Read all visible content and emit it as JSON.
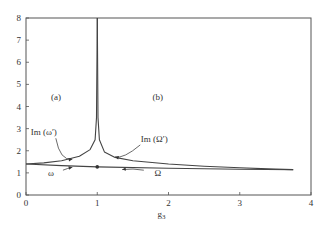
{
  "chart_data": {
    "type": "line",
    "title": "",
    "xlabel": "g3",
    "ylabel": "",
    "xlim": [
      0,
      4
    ],
    "ylim": [
      0,
      8
    ],
    "x_ticks": [
      "0",
      "1",
      "2",
      "3",
      "4"
    ],
    "y_ticks": [
      "0",
      "1",
      "2",
      "3",
      "4",
      "5",
      "6",
      "7",
      "8"
    ],
    "grid": false,
    "legend": "none (inline annotations)",
    "panel_labels": [
      "(a)",
      "(b)"
    ],
    "series": [
      {
        "name": "Im (ω′)",
        "region": "a",
        "x": [
          0,
          0.25,
          0.5,
          0.75,
          0.9,
          0.97,
          0.99,
          1.0
        ],
        "y": [
          1.4,
          1.45,
          1.55,
          1.75,
          2.05,
          2.5,
          3.5,
          8.0
        ]
      },
      {
        "name": "Im (Ω′)",
        "region": "b",
        "x": [
          1.0,
          1.01,
          1.03,
          1.1,
          1.25,
          1.5,
          2.0,
          2.5,
          3.0,
          3.5,
          3.75
        ],
        "y": [
          8.0,
          3.5,
          2.5,
          1.95,
          1.7,
          1.55,
          1.4,
          1.3,
          1.23,
          1.17,
          1.15
        ]
      },
      {
        "name": "ω",
        "region": "a",
        "x": [
          0,
          0.5,
          1.0
        ],
        "y": [
          1.4,
          1.33,
          1.27
        ]
      },
      {
        "name": "Ω",
        "region": "b",
        "x": [
          1.0,
          2.0,
          3.0,
          3.75
        ],
        "y": [
          1.27,
          1.21,
          1.16,
          1.14
        ]
      }
    ],
    "annotations": [
      {
        "text": "(a)",
        "x": 0.42,
        "y": 4.3
      },
      {
        "text": "(b)",
        "x": 1.85,
        "y": 4.3
      },
      {
        "text": "Im (ω′)",
        "x": 0.25,
        "y": 2.7,
        "arrow_to": [
          0.65,
          1.62
        ]
      },
      {
        "text": "Im (Ω′)",
        "x": 1.8,
        "y": 2.4,
        "arrow_to": [
          1.25,
          1.72
        ]
      },
      {
        "text": "ω",
        "x": 0.35,
        "y": 0.85,
        "arrow_to": [
          0.65,
          1.25
        ]
      },
      {
        "text": "Ω",
        "x": 1.85,
        "y": 0.85,
        "arrow_to": [
          1.35,
          1.15
        ]
      }
    ],
    "marker": {
      "x": 1.0,
      "y": 1.27,
      "shape": "dot"
    }
  }
}
